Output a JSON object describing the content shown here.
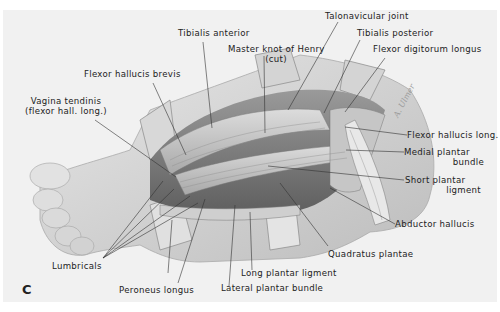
{
  "figure": {
    "panel_letter": "C",
    "signature": "A. Ulmer",
    "background_color": "#f1f1f1"
  },
  "labels": {
    "talonavicular_joint": "Talonavicular joint",
    "tibialis_anterior": "Tibialis anterior",
    "tibialis_posterior": "Tibialis posterior",
    "master_knot_line1": "Master knot of Henry",
    "master_knot_line2": "(cut)",
    "flexor_digitorum_longus": "Flexor digitorum longus",
    "flexor_hallucis_brevis": "Flexor hallucis brevis",
    "vagina_tendinis_line1": "Vagina tendinis",
    "vagina_tendinis_line2": "(flexor hall. long.)",
    "flexor_hallucis_long": "Flexor hallucis long.",
    "medial_plantar_line1": "Medial plantar",
    "medial_plantar_line2": "bundle",
    "short_plantar_line1": "Short plantar",
    "short_plantar_line2": "ligment",
    "abductor_hallucis": "Abductor hallucis",
    "quadratus_plantae": "Quadratus plantae",
    "lumbricals": "Lumbricals",
    "long_plantar_ligment": "Long plantar ligment",
    "peroneus_longus": "Peroneus longus",
    "lateral_plantar_bundle": "Lateral plantar bundle"
  }
}
